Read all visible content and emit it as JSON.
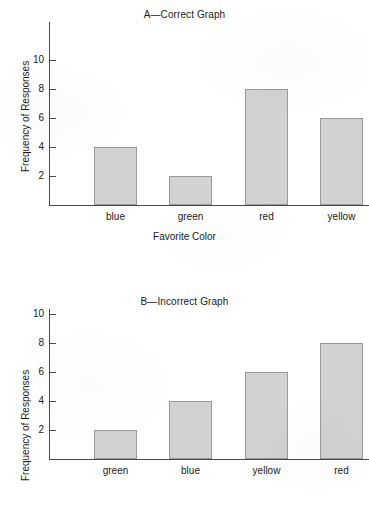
{
  "chart_data": [
    {
      "id": "A",
      "type": "bar",
      "title": "A—Correct Graph",
      "categories": [
        "blue",
        "green",
        "red",
        "yellow"
      ],
      "values": [
        4,
        2,
        8,
        6
      ],
      "xlabel": "Favorite Color",
      "ylabel": "Frequency of Responses",
      "ylim": [
        0,
        12
      ],
      "yticks": [
        2,
        4,
        6,
        8,
        10
      ],
      "ytick_labels": [
        "2",
        "4",
        "6",
        "8",
        "10"
      ],
      "grid": false,
      "legend": false,
      "bar_fill": "#d2d2d2",
      "bar_border": "#9a9a9a",
      "axis_color": "#4a4a4a"
    },
    {
      "id": "B",
      "type": "bar",
      "title": "B—Incorrect Graph",
      "categories": [
        "green",
        "blue",
        "yellow",
        "red"
      ],
      "values": [
        2,
        4,
        6,
        8
      ],
      "xlabel": "",
      "ylabel": "Frequency of Responses",
      "ylim": [
        0,
        12
      ],
      "yticks": [
        2,
        4,
        6,
        8,
        10
      ],
      "ytick_labels": [
        "2",
        "4",
        "6",
        "8",
        "10"
      ],
      "grid": false,
      "legend": false,
      "bar_fill": "#d2d2d2",
      "bar_border": "#9a9a9a",
      "axis_color": "#4a4a4a"
    }
  ]
}
